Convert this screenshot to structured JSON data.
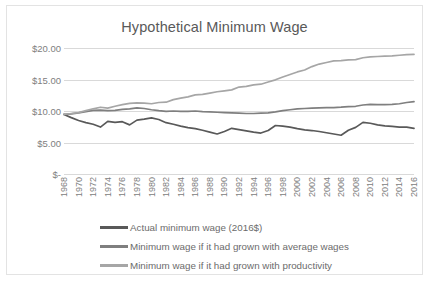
{
  "chart_data": {
    "type": "line",
    "title": "Hypothetical Minimum Wage",
    "xlabel": "",
    "ylabel": "",
    "ylim": [
      0,
      20
    ],
    "yticks": [
      0,
      5,
      10,
      15,
      20
    ],
    "ytick_labels": [
      "$-",
      "$5.00",
      "$10.00",
      "$15.00",
      "$20.00"
    ],
    "grid": true,
    "legend_position": "bottom",
    "xlim": [
      1968,
      2016
    ],
    "categories": [
      1968,
      1969,
      1970,
      1971,
      1972,
      1973,
      1974,
      1975,
      1976,
      1977,
      1978,
      1979,
      1980,
      1981,
      1982,
      1983,
      1984,
      1985,
      1986,
      1987,
      1988,
      1989,
      1990,
      1991,
      1992,
      1993,
      1994,
      1995,
      1996,
      1997,
      1998,
      1999,
      2000,
      2001,
      2002,
      2003,
      2004,
      2005,
      2006,
      2007,
      2008,
      2009,
      2010,
      2011,
      2012,
      2013,
      2014,
      2015,
      2016
    ],
    "xtick_labels": [
      "1968",
      "1970",
      "1972",
      "1974",
      "1976",
      "1978",
      "1980",
      "1982",
      "1984",
      "1986",
      "1988",
      "1990",
      "1992",
      "1994",
      "1996",
      "1998",
      "2000",
      "2002",
      "2004",
      "2006",
      "2008",
      "2010",
      "2012",
      "2014",
      "2016"
    ],
    "series": [
      {
        "name": "Actual minimum wage (2016$)",
        "color": "#595959",
        "values": [
          9.45,
          8.95,
          8.5,
          8.15,
          7.9,
          7.45,
          8.35,
          8.2,
          8.3,
          7.8,
          8.55,
          8.7,
          8.9,
          8.65,
          8.15,
          7.9,
          7.6,
          7.35,
          7.2,
          6.95,
          6.65,
          6.35,
          6.75,
          7.25,
          7.05,
          6.85,
          6.65,
          6.5,
          6.9,
          7.7,
          7.6,
          7.45,
          7.2,
          7.0,
          6.9,
          6.75,
          6.55,
          6.35,
          6.15,
          6.95,
          7.4,
          8.2,
          8.05,
          7.8,
          7.65,
          7.55,
          7.45,
          7.45,
          7.25
        ]
      },
      {
        "name": "Minimum wage if it had grown with average wages",
        "color": "#7f7f7f",
        "values": [
          9.45,
          9.55,
          9.7,
          9.9,
          10.1,
          10.15,
          10.05,
          10.1,
          10.25,
          10.35,
          10.5,
          10.4,
          10.2,
          10.05,
          9.95,
          10.0,
          9.95,
          9.95,
          10.0,
          9.9,
          9.85,
          9.8,
          9.75,
          9.7,
          9.65,
          9.6,
          9.6,
          9.65,
          9.7,
          9.85,
          10.05,
          10.2,
          10.35,
          10.4,
          10.45,
          10.5,
          10.55,
          10.55,
          10.6,
          10.7,
          10.75,
          10.95,
          11.05,
          11.0,
          11.0,
          11.05,
          11.15,
          11.35,
          11.5
        ]
      },
      {
        "name": "Minimum wage if it had grown with productivity",
        "color": "#a6a6a6",
        "values": [
          9.45,
          9.6,
          9.75,
          10.05,
          10.35,
          10.6,
          10.45,
          10.75,
          11.0,
          11.2,
          11.3,
          11.25,
          11.15,
          11.35,
          11.4,
          11.8,
          12.05,
          12.25,
          12.55,
          12.65,
          12.85,
          13.05,
          13.2,
          13.35,
          13.8,
          13.9,
          14.15,
          14.25,
          14.6,
          14.95,
          15.4,
          15.8,
          16.2,
          16.5,
          17.05,
          17.45,
          17.7,
          17.95,
          18.0,
          18.1,
          18.15,
          18.45,
          18.6,
          18.65,
          18.7,
          18.75,
          18.85,
          18.95,
          19.0
        ]
      }
    ]
  },
  "legend": {
    "items": [
      {
        "label": "Actual minimum wage (2016$)",
        "color": "#595959"
      },
      {
        "label": "Minimum wage if it had grown with average wages",
        "color": "#7f7f7f"
      },
      {
        "label": "Minimum wage if it had grown with productivity",
        "color": "#a6a6a6"
      }
    ]
  }
}
